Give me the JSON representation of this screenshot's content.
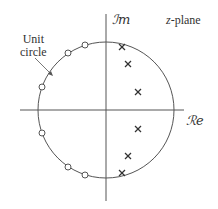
{
  "figure": {
    "plane_label_var": "z",
    "plane_label_rest": "-plane",
    "imag_axis_label": "ℐm",
    "real_axis_label": "ℛe",
    "unit_circle_label_line1": "Unit",
    "unit_circle_label_line2": "circle",
    "colors": {
      "stroke": "#555555",
      "text": "#333333",
      "background": "#ffffff"
    }
  },
  "geometry": {
    "center": [
      106,
      110
    ],
    "radius": 68,
    "real_axis_x": [
      20,
      184
    ],
    "imag_axis_y": [
      14,
      201
    ]
  },
  "poles": [
    {
      "x": 122,
      "y": 47
    },
    {
      "x": 128,
      "y": 64
    },
    {
      "x": 138,
      "y": 92
    },
    {
      "x": 138,
      "y": 129
    },
    {
      "x": 128,
      "y": 156
    },
    {
      "x": 122,
      "y": 173
    }
  ],
  "zeros": [
    {
      "x": 85,
      "y": 45
    },
    {
      "x": 68,
      "y": 53
    },
    {
      "x": 42,
      "y": 87
    },
    {
      "x": 42,
      "y": 133
    },
    {
      "x": 68,
      "y": 167
    },
    {
      "x": 85,
      "y": 175
    }
  ]
}
